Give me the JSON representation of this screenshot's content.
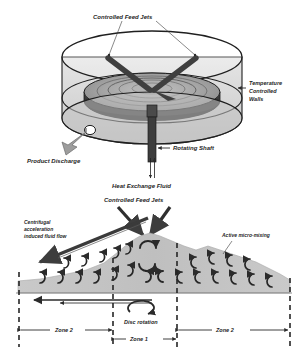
{
  "figure": {
    "top_panel": {
      "name": "vessel-cutaway-view",
      "labels": {
        "feed_jets": "Controlled Feed Jets",
        "temperature_walls_line1": "Temperature",
        "temperature_walls_line2": "Controlled",
        "temperature_walls_line3": "Walls",
        "product_discharge": "Product Discharge",
        "rotating_shaft": "Rotating Shaft",
        "heat_exchange_fluid": "Heat Exchange Fluid"
      }
    },
    "bottom_panel": {
      "name": "film-flow-cross-section",
      "labels": {
        "feed_jets": "Controlled Feed Jets",
        "centrifugal_line1": "Centrifugal",
        "centrifugal_line2": "acceleration",
        "centrifugal_line3": "induced fluid flow",
        "active_mixing": "Active micro-mixing",
        "disc_rotation": "Disc rotation",
        "zone_left": "Zone 2",
        "zone_center": "Zone 1",
        "zone_right": "Zone 2"
      }
    },
    "colors": {
      "outline": "#1f1f1f",
      "disc_fill": "#9a9a9a",
      "disc_light": "#b9b9b9",
      "vessel_glass": "#cfcfcf",
      "film_fill": "#c6c6c6",
      "arrow": "#3d3d3d",
      "background": "#ffffff"
    }
  }
}
